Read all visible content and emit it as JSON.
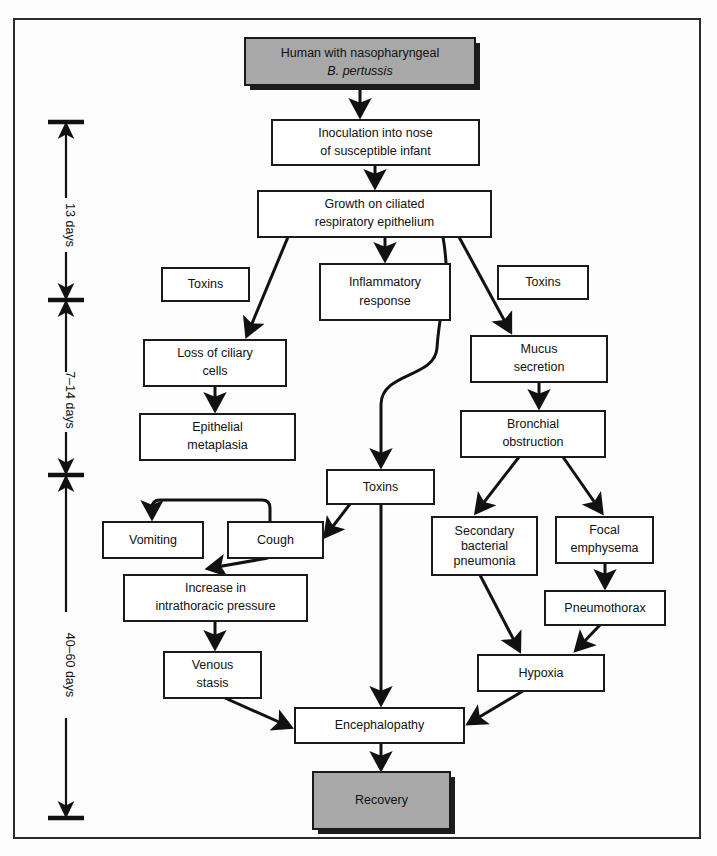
{
  "figure": {
    "type": "flowchart",
    "orientation": "top-to-bottom",
    "colors": {
      "shaded_fill": "#a8a8a8",
      "box_fill": "#ffffff",
      "stroke": "#1a1a1a",
      "background": "#fdfdfd"
    }
  },
  "timeline": {
    "axis_label": "time course",
    "segments": [
      {
        "id": "seg-13-days",
        "label": "13 days",
        "start_y": 122,
        "end_y": 300
      },
      {
        "id": "seg-7-14-days",
        "label": "7–14 days",
        "start_y": 300,
        "end_y": 475
      },
      {
        "id": "seg-40-60-days",
        "label": "40–60 days",
        "start_y": 475,
        "end_y": 818
      }
    ],
    "tick_positions": [
      122,
      300,
      475,
      818
    ]
  },
  "nodes": [
    {
      "id": "human",
      "lines": [
        "Human with nasopharyngeal",
        "B. pertussis"
      ],
      "italic_lines": [
        1
      ],
      "x": 245,
      "y": 38,
      "w": 230,
      "h": 47,
      "shaded": true
    },
    {
      "id": "inoculation",
      "lines": [
        "Inoculation into nose",
        "of susceptible infant"
      ],
      "italic_lines": [],
      "x": 272,
      "y": 120,
      "w": 207,
      "h": 45,
      "shaded": false
    },
    {
      "id": "growth",
      "lines": [
        "Growth on ciliated",
        "respiratory epithelium"
      ],
      "italic_lines": [],
      "x": 258,
      "y": 191,
      "w": 233,
      "h": 46,
      "shaded": false
    },
    {
      "id": "toxins-left",
      "lines": [
        "Toxins"
      ],
      "italic_lines": [],
      "x": 162,
      "y": 268,
      "w": 87,
      "h": 33,
      "shaded": false
    },
    {
      "id": "inflammatory",
      "lines": [
        "Inflammatory",
        "response"
      ],
      "italic_lines": [],
      "x": 320,
      "y": 264,
      "w": 130,
      "h": 56,
      "shaded": false
    },
    {
      "id": "toxins-right",
      "lines": [
        "Toxins"
      ],
      "italic_lines": [],
      "x": 498,
      "y": 266,
      "w": 90,
      "h": 33,
      "shaded": false
    },
    {
      "id": "loss-ciliary",
      "lines": [
        "Loss of ciliary",
        "cells"
      ],
      "italic_lines": [],
      "x": 144,
      "y": 340,
      "w": 142,
      "h": 46,
      "shaded": false
    },
    {
      "id": "mucus",
      "lines": [
        "Mucus",
        "secretion"
      ],
      "italic_lines": [],
      "x": 471,
      "y": 336,
      "w": 136,
      "h": 46,
      "shaded": false
    },
    {
      "id": "epithelial",
      "lines": [
        "Epithelial",
        "metaplasia"
      ],
      "italic_lines": [],
      "x": 140,
      "y": 414,
      "w": 155,
      "h": 46,
      "shaded": false
    },
    {
      "id": "bronchial",
      "lines": [
        "Bronchial",
        "obstruction"
      ],
      "italic_lines": [],
      "x": 461,
      "y": 411,
      "w": 144,
      "h": 46,
      "shaded": false
    },
    {
      "id": "toxins-mid",
      "lines": [
        "Toxins"
      ],
      "italic_lines": [],
      "x": 327,
      "y": 470,
      "w": 107,
      "h": 34,
      "shaded": false
    },
    {
      "id": "vomiting",
      "lines": [
        "Vomiting"
      ],
      "italic_lines": [],
      "x": 103,
      "y": 522,
      "w": 100,
      "h": 36,
      "shaded": false
    },
    {
      "id": "cough",
      "lines": [
        "Cough"
      ],
      "italic_lines": [],
      "x": 228,
      "y": 522,
      "w": 95,
      "h": 36,
      "shaded": false
    },
    {
      "id": "secondary",
      "lines": [
        "Secondary",
        "bacterial",
        "pneumonia"
      ],
      "italic_lines": [],
      "x": 432,
      "y": 517,
      "w": 105,
      "h": 58,
      "shaded": false
    },
    {
      "id": "focal",
      "lines": [
        "Focal",
        "emphysema"
      ],
      "italic_lines": [],
      "x": 556,
      "y": 517,
      "w": 97,
      "h": 46,
      "shaded": false
    },
    {
      "id": "increase",
      "lines": [
        "Increase in",
        "intrathoracic pressure"
      ],
      "italic_lines": [],
      "x": 124,
      "y": 575,
      "w": 183,
      "h": 46,
      "shaded": false
    },
    {
      "id": "pneumothorax",
      "lines": [
        "Pneumothorax"
      ],
      "italic_lines": [],
      "x": 545,
      "y": 591,
      "w": 120,
      "h": 34,
      "shaded": false
    },
    {
      "id": "venous",
      "lines": [
        "Venous",
        "stasis"
      ],
      "italic_lines": [],
      "x": 164,
      "y": 652,
      "w": 97,
      "h": 46,
      "shaded": false
    },
    {
      "id": "hypoxia",
      "lines": [
        "Hypoxia"
      ],
      "italic_lines": [],
      "x": 478,
      "y": 655,
      "w": 126,
      "h": 36,
      "shaded": false
    },
    {
      "id": "encephalo",
      "lines": [
        "Encephalopathy"
      ],
      "italic_lines": [],
      "x": 295,
      "y": 708,
      "w": 169,
      "h": 35,
      "shaded": false
    },
    {
      "id": "recovery",
      "lines": [
        "Recovery"
      ],
      "italic_lines": [],
      "x": 313,
      "y": 772,
      "w": 137,
      "h": 57,
      "shaded": true
    }
  ],
  "edges": [
    {
      "from": "human",
      "to": "inoculation",
      "kind": "straight"
    },
    {
      "from": "inoculation",
      "to": "growth",
      "kind": "straight"
    },
    {
      "from": "growth",
      "to": "loss-ciliary",
      "kind": "diagonal"
    },
    {
      "from": "growth",
      "to": "inflammatory",
      "kind": "straight"
    },
    {
      "from": "growth",
      "to": "toxins-mid",
      "kind": "curved"
    },
    {
      "from": "growth",
      "to": "mucus",
      "kind": "diagonal"
    },
    {
      "from": "loss-ciliary",
      "to": "epithelial",
      "kind": "straight"
    },
    {
      "from": "mucus",
      "to": "bronchial",
      "kind": "straight"
    },
    {
      "from": "toxins-mid",
      "to": "cough",
      "kind": "diagonal"
    },
    {
      "from": "toxins-mid",
      "to": "encephalo",
      "kind": "straight"
    },
    {
      "from": "cough",
      "to": "vomiting",
      "kind": "curved-over"
    },
    {
      "from": "cough",
      "to": "increase",
      "kind": "diagonal"
    },
    {
      "from": "bronchial",
      "to": "secondary",
      "kind": "diagonal"
    },
    {
      "from": "bronchial",
      "to": "focal",
      "kind": "diagonal"
    },
    {
      "from": "increase",
      "to": "venous",
      "kind": "straight"
    },
    {
      "from": "focal",
      "to": "pneumothorax",
      "kind": "straight"
    },
    {
      "from": "secondary",
      "to": "hypoxia",
      "kind": "diagonal"
    },
    {
      "from": "pneumothorax",
      "to": "hypoxia",
      "kind": "diagonal"
    },
    {
      "from": "venous",
      "to": "encephalo",
      "kind": "diagonal"
    },
    {
      "from": "hypoxia",
      "to": "encephalo",
      "kind": "diagonal"
    },
    {
      "from": "encephalo",
      "to": "recovery",
      "kind": "straight"
    }
  ]
}
